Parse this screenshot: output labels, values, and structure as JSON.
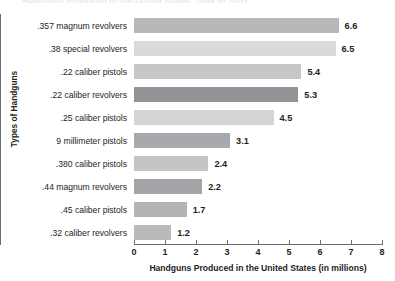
{
  "chart_data": {
    "type": "bar",
    "orientation": "horizontal",
    "title": "Handguns Produced in the United States, 1998 to 2003",
    "xlabel": "Handguns Produced in the United States (in millions)",
    "ylabel": "Types of Handguns",
    "xlim": [
      0,
      8
    ],
    "xticks": [
      "0",
      "1",
      "2",
      "3",
      "4",
      "5",
      "6",
      "7",
      "8"
    ],
    "grid": false,
    "legend": "none",
    "categories": [
      ".357 magnum revolvers",
      ".38 special revolvers",
      ".22 caliber pistols",
      ".22 caliber revolvers",
      ".25 caliber pistols",
      "9 millimeter pistols",
      ".380 caliber pistols",
      ".44 magnum revolvers",
      ".45 caliber pistols",
      ".32 caliber revolvers"
    ],
    "values": [
      6.6,
      6.5,
      5.4,
      5.3,
      4.5,
      3.1,
      2.4,
      2.2,
      1.7,
      1.2
    ],
    "value_labels": [
      "6.6",
      "6.5",
      "5.4",
      "5.3",
      "4.5",
      "3.1",
      "2.4",
      "2.2",
      "1.7",
      "1.2"
    ],
    "bar_colors": [
      "#b7b8ba",
      "#d9dadb",
      "#c6c7c9",
      "#929497",
      "#d3d4d6",
      "#a7a9ac",
      "#c4c5c7",
      "#a2a4a7",
      "#b2b4b6",
      "#b9babc"
    ],
    "axis_color": "#6d6e71",
    "text_color": "#231f20",
    "background_color": "#ffffff"
  }
}
